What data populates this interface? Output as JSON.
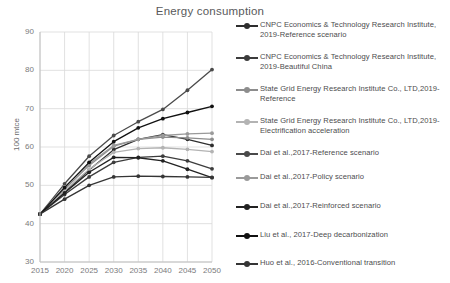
{
  "chart_data": {
    "type": "line",
    "title": "Energy consumption",
    "xlabel": "",
    "ylabel": "100 mtce",
    "x": [
      2015,
      2020,
      2025,
      2030,
      2035,
      2040,
      2045,
      2050
    ],
    "xtick_labels": [
      "2015",
      "2020",
      "2025",
      "2030",
      "2035",
      "2040",
      "2045",
      "2050"
    ],
    "ytick_labels": [
      "30",
      "40",
      "50",
      "60",
      "70",
      "80",
      "90"
    ],
    "yticks": [
      30,
      40,
      50,
      60,
      70,
      80,
      90
    ],
    "ylim": [
      30,
      90
    ],
    "xlim": [
      2015,
      2050
    ],
    "grid": true,
    "legend_position": "right",
    "series": [
      {
        "name": "CNPC Economics & Technology Research Institute, 2019-Reference scenario",
        "color": "#2e2e2e",
        "values": [
          42.5,
          48.2,
          54.0,
          59.3,
          62.0,
          63.2,
          62.0,
          60.4
        ]
      },
      {
        "name": "CNPC Economics & Technology Research Institute, 2019-Beautiful China",
        "color": "#3c3c3c",
        "values": [
          42.5,
          47.6,
          52.2,
          56.0,
          57.3,
          57.6,
          56.4,
          54.3
        ]
      },
      {
        "name": "State Grid Energy Research Institute Co., LTD,2019-Reference",
        "color": "#8d8d8d",
        "values": [
          42.5,
          49.0,
          55.2,
          60.2,
          62.0,
          62.6,
          62.4,
          62.0
        ]
      },
      {
        "name": "State Grid Energy Research Institute Co., LTD,2019-Electrification acceleration",
        "color": "#b3b3b3",
        "values": [
          42.5,
          48.6,
          54.2,
          58.6,
          59.6,
          59.8,
          59.4,
          58.8
        ]
      },
      {
        "name": "Dai et al.,2017-Reference scenario",
        "color": "#4a4a4a",
        "values": [
          42.5,
          50.4,
          57.6,
          63.0,
          66.6,
          69.8,
          74.8,
          80.2
        ]
      },
      {
        "name": "Dai et al.,2017-Policy scenario",
        "color": "#9a9a9a",
        "values": [
          42.5,
          49.6,
          55.6,
          60.4,
          62.0,
          63.0,
          63.4,
          63.6
        ]
      },
      {
        "name": "Dai et al.,2017-Reinforced scenario",
        "color": "#222222",
        "values": [
          42.5,
          48.0,
          53.4,
          57.3,
          57.2,
          56.4,
          54.2,
          52.0
        ]
      },
      {
        "name": "Liu et al., 2017-Deep decarbonization",
        "color": "#111111",
        "values": [
          42.5,
          49.4,
          56.0,
          61.4,
          65.0,
          67.4,
          69.0,
          70.6
        ]
      },
      {
        "name": "Huo et al., 2016-Conventional transition",
        "color": "#353535",
        "values": [
          42.5,
          46.4,
          50.0,
          52.2,
          52.4,
          52.3,
          52.2,
          52.1
        ]
      }
    ]
  },
  "legend": {
    "items": [
      {
        "label": "CNPC Economics & Technology Research Institute, 2019-Reference scenario",
        "color": "#2e2e2e",
        "top": 0
      },
      {
        "label": "CNPC Economics & Technology Research Institute, 2019-Beautiful China",
        "color": "#3c3c3c",
        "top": 32
      },
      {
        "label": "State Grid Energy Research Institute Co., LTD,2019-Reference",
        "color": "#8d8d8d",
        "top": 64
      },
      {
        "label": "State Grid Energy Research Institute Co., LTD,2019-Electrification acceleration",
        "color": "#b3b3b3",
        "top": 96
      },
      {
        "label": "Dai et al.,2017-Reference scenario",
        "color": "#4a4a4a",
        "top": 128
      },
      {
        "label": "Dai et al.,2017-Policy scenario",
        "color": "#9a9a9a",
        "top": 152
      },
      {
        "label": "Dai et al.,2017-Reinforced scenario",
        "color": "#222222",
        "top": 181
      },
      {
        "label": "Liu et al., 2017-Deep decarbonization",
        "color": "#111111",
        "top": 210
      },
      {
        "label": "Huo et al., 2016-Conventional transition",
        "color": "#353535",
        "top": 238
      }
    ]
  }
}
